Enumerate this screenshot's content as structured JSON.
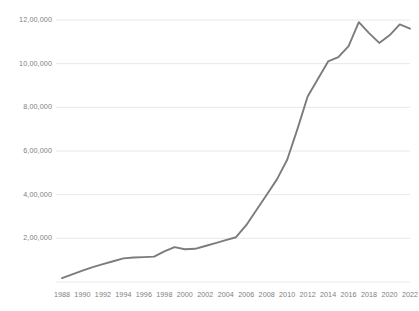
{
  "chart_data": {
    "type": "line",
    "title": "",
    "subtitle": "",
    "xlabel": "",
    "ylabel": "",
    "grid": true,
    "legend": false,
    "legend_position": "none",
    "line_color": "#7c7c7c",
    "gridline_color": "#e8e8e8",
    "tick_label_color": "#808080",
    "background_color": "#ffffff",
    "xlim": [
      1988,
      2022
    ],
    "ylim": [
      0,
      1200000
    ],
    "ytick_labels": [
      "12,00,000",
      "10,00,000",
      "8,00,000",
      "6,00,000",
      "4,00,000",
      "2,00,000"
    ],
    "ytick_values": [
      1200000,
      1000000,
      800000,
      600000,
      400000,
      200000
    ],
    "xtick_labels": [
      "1988",
      "1990",
      "1992",
      "1994",
      "1996",
      "1998",
      "2000",
      "2002",
      "2004",
      "2006",
      "2008",
      "2010",
      "2012",
      "2014",
      "2016",
      "2018",
      "2020",
      "2022"
    ],
    "xtick_values": [
      1988,
      1990,
      1992,
      1994,
      1996,
      1998,
      2000,
      2002,
      2004,
      2006,
      2008,
      2010,
      2012,
      2014,
      2016,
      2018,
      2020,
      2022
    ],
    "x": [
      1988,
      1989,
      1990,
      1991,
      1992,
      1993,
      1994,
      1995,
      1996,
      1997,
      1998,
      1999,
      2000,
      2001,
      2002,
      2003,
      2004,
      2005,
      2006,
      2007,
      2008,
      2009,
      2010,
      2011,
      2012,
      2013,
      2014,
      2015,
      2016,
      2017,
      2018,
      2019,
      2020,
      2021,
      2022
    ],
    "series": [
      {
        "name": "Value",
        "values": [
          18000,
          35000,
          52000,
          68000,
          82000,
          95000,
          108000,
          112000,
          114000,
          116000,
          140000,
          160000,
          150000,
          152000,
          165000,
          178000,
          192000,
          205000,
          260000,
          330000,
          400000,
          470000,
          560000,
          700000,
          850000,
          930000,
          1010000,
          1030000,
          1080000,
          1190000,
          1140000,
          1095000,
          1130000,
          1180000,
          1160000
        ]
      }
    ]
  }
}
